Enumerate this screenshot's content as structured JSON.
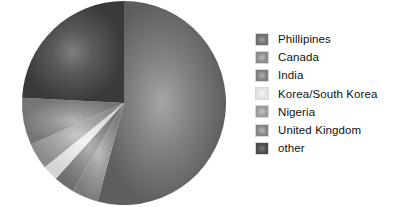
{
  "chart_data": {
    "type": "pie",
    "title": "",
    "legend_position": "right",
    "grid": false,
    "categories": [
      "Phillipines",
      "Canada",
      "India",
      "Korea/South Korea",
      "Nigeria",
      "United Kingdom",
      "other"
    ],
    "values": [
      54.2,
      4.2,
      3.3,
      2.5,
      4.2,
      7.5,
      24.1
    ],
    "slices": [
      {
        "label": "Phillipines",
        "value": 54.2,
        "color": "#6e6e6e",
        "start_angle_deg": 0,
        "end_angle_deg": 195
      },
      {
        "label": "Canada",
        "value": 4.2,
        "color": "#8a8a8a",
        "start_angle_deg": 195,
        "end_angle_deg": 210
      },
      {
        "label": "India",
        "value": 3.3,
        "color": "#7d7d7d",
        "start_angle_deg": 210,
        "end_angle_deg": 222
      },
      {
        "label": "Korea/South Korea",
        "value": 2.5,
        "color": "#e2e2e2",
        "start_angle_deg": 222,
        "end_angle_deg": 231
      },
      {
        "label": "Nigeria",
        "value": 4.2,
        "color": "#9a9a9a",
        "start_angle_deg": 231,
        "end_angle_deg": 246
      },
      {
        "label": "United Kingdom",
        "value": 7.5,
        "color": "#848484",
        "start_angle_deg": 246,
        "end_angle_deg": 273
      },
      {
        "label": "other",
        "value": 24.1,
        "color": "#4a4a4a",
        "start_angle_deg": 273,
        "end_angle_deg": 360
      }
    ],
    "geometry": {
      "center_x": 124,
      "center_y": 103,
      "radius": 102
    }
  },
  "legend": {
    "items": [
      {
        "label": "Phillipines",
        "color": "#6e6e6e",
        "swatch_highlight": "#9d9d9d"
      },
      {
        "label": "Canada",
        "color": "#8a8a8a",
        "swatch_highlight": "#bcbcbc"
      },
      {
        "label": "India",
        "color": "#7d7d7d",
        "swatch_highlight": "#b4b4b4"
      },
      {
        "label": "Korea/South Korea",
        "color": "#e2e2e2",
        "swatch_highlight": "#f6f6f6"
      },
      {
        "label": "Nigeria",
        "color": "#9a9a9a",
        "swatch_highlight": "#c6c6c6"
      },
      {
        "label": "United Kingdom",
        "color": "#848484",
        "swatch_highlight": "#b8b8b8"
      },
      {
        "label": "other",
        "color": "#4a4a4a",
        "swatch_highlight": "#7a7a7a"
      }
    ]
  },
  "colors": {
    "background": "#ffffff",
    "text": "#111111",
    "swatch_border": "#d8d8d8"
  }
}
